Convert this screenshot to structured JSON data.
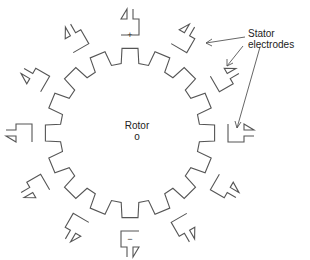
{
  "diagram": {
    "rotor_label": "Rotor",
    "rotor_center_mark": "o",
    "stator_label_line1": "Stator",
    "stator_label_line2": "electrodes",
    "plus_sign": "+",
    "minus_sign": "−",
    "rotor_teeth": 16,
    "stator_electrode_count": 12,
    "line_color": "#555555"
  }
}
